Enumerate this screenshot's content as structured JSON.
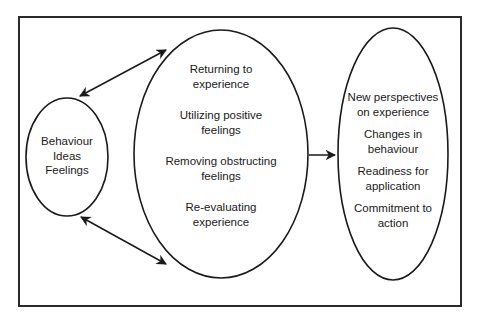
{
  "diagram": {
    "type": "process-flow",
    "stroke_color": "#1a1a1a",
    "left_node": {
      "items": [
        "Behaviour",
        "Ideas",
        "Feelings"
      ]
    },
    "middle_node": {
      "items": [
        "Returning to experience",
        "Utilizing positive feelings",
        "Removing obstructing feelings",
        "Re-evaluating experience"
      ]
    },
    "right_node": {
      "items": [
        "New perspectives on experience",
        "Changes in behaviour",
        "Readiness for application",
        "Commitment to action"
      ]
    },
    "connections": [
      {
        "from": "left_node",
        "to": "middle_node",
        "style": "double-arrow",
        "position": "top"
      },
      {
        "from": "left_node",
        "to": "middle_node",
        "style": "double-arrow",
        "position": "bottom"
      },
      {
        "from": "middle_node",
        "to": "right_node",
        "style": "single-arrow",
        "position": "middle"
      }
    ]
  },
  "text": {
    "left": {
      "l1": "Behaviour",
      "l2": "Ideas",
      "l3": "Feelings"
    },
    "middle": {
      "m1a": "Returning to",
      "m1b": "experience",
      "m2a": "Utilizing positive",
      "m2b": "feelings",
      "m3a": "Removing obstructing",
      "m3b": "feelings",
      "m4a": "Re-evaluating",
      "m4b": "experience"
    },
    "right": {
      "r1a": "New perspectives",
      "r1b": "on experience",
      "r2a": "Changes in",
      "r2b": "behaviour",
      "r3a": "Readiness for",
      "r3b": "application",
      "r4a": "Commitment to",
      "r4b": "action"
    }
  }
}
